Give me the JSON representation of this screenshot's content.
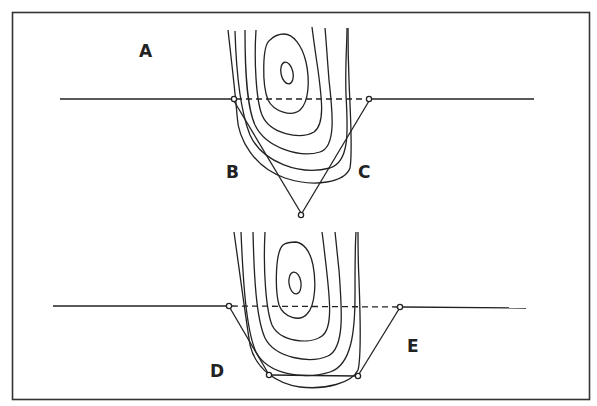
{
  "figure": {
    "labels": {
      "A": "A",
      "B": "B",
      "C": "C",
      "D": "D",
      "E": "E"
    },
    "panels": [
      {
        "name": "top-panel",
        "surface_line": "solid line with dashed section between the two open-circle nodes",
        "outline_shape": "triangle (V-shape) with three nodes",
        "labels": [
          "A",
          "B",
          "C"
        ]
      },
      {
        "name": "bottom-panel",
        "surface_line": "solid line with dashed section between the two open-circle nodes",
        "outline_shape": "trapezoid with four nodes",
        "labels": [
          "D",
          "E"
        ]
      }
    ],
    "colors": {
      "line": "#222222",
      "background": "#ffffff",
      "frame": "#333333"
    }
  }
}
